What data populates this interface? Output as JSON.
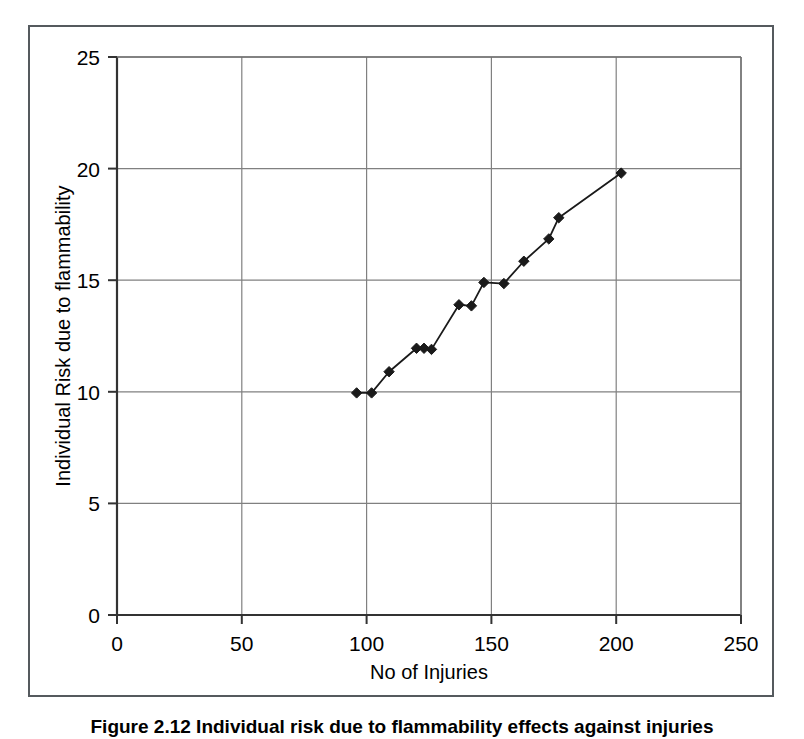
{
  "figure": {
    "caption": "Figure 2.12   Individual risk due to flammability effects against injuries",
    "frame_color": "#555a5e"
  },
  "chart_data": {
    "type": "line",
    "title": "",
    "subtitle": "",
    "xlabel": "No of Injuries",
    "ylabel": "Individual Risk due to flammability",
    "xlim": [
      0,
      250
    ],
    "ylim": [
      0,
      25
    ],
    "xticks": [
      0,
      50,
      100,
      150,
      200,
      250
    ],
    "yticks": [
      0,
      5,
      10,
      15,
      20,
      25
    ],
    "xtick_labels": [
      "0",
      "50",
      "100",
      "150",
      "200",
      "250"
    ],
    "ytick_labels": [
      "0",
      "5",
      "10",
      "15",
      "20",
      "25"
    ],
    "grid": true,
    "grid_color": "#808080",
    "legend": false,
    "legend_position": "none",
    "marker": "diamond",
    "marker_color": "#1a1a1a",
    "line_color": "#1a1a1a",
    "series": [
      {
        "name": "Individual Risk due to flammability",
        "x": [
          96,
          102,
          109,
          120,
          123,
          126,
          137,
          142,
          147,
          155,
          163,
          173,
          177,
          202
        ],
        "y": [
          9.95,
          9.95,
          10.9,
          11.95,
          11.95,
          11.9,
          13.9,
          13.85,
          14.9,
          14.85,
          15.85,
          16.85,
          17.8,
          19.8
        ]
      }
    ],
    "points": [
      {
        "x": 96,
        "y": 9.95
      },
      {
        "x": 102,
        "y": 9.95
      },
      {
        "x": 109,
        "y": 10.9
      },
      {
        "x": 120,
        "y": 11.95
      },
      {
        "x": 123,
        "y": 11.95
      },
      {
        "x": 126,
        "y": 11.9
      },
      {
        "x": 137,
        "y": 13.9
      },
      {
        "x": 142,
        "y": 13.85
      },
      {
        "x": 147,
        "y": 14.9
      },
      {
        "x": 155,
        "y": 14.85
      },
      {
        "x": 163,
        "y": 15.85
      },
      {
        "x": 173,
        "y": 16.85
      },
      {
        "x": 177,
        "y": 17.8
      },
      {
        "x": 202,
        "y": 19.8
      }
    ]
  }
}
